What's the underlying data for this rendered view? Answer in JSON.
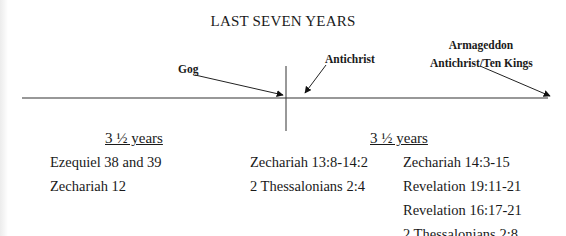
{
  "title": "LAST SEVEN YEARS",
  "timeline": {
    "markers": [
      {
        "label": "Gog"
      },
      {
        "label": "Antichrist"
      },
      {
        "label_lines": [
          "Armageddon",
          "Antichrist/Ten Kings"
        ]
      }
    ]
  },
  "periods": [
    {
      "heading": "3 ½ years"
    },
    {
      "heading": "3 ½ years"
    }
  ],
  "columns": {
    "left": [
      "Ezequiel 38 and 39",
      "Zechariah 12"
    ],
    "middle": [
      "Zechariah 13:8-14:2",
      "2 Thessalonians 2:4"
    ],
    "right": [
      "Zechariah 14:3-15",
      "Revelation 19:11-21",
      "Revelation 16:17-21",
      "2 Thessalonians 2:8"
    ]
  }
}
